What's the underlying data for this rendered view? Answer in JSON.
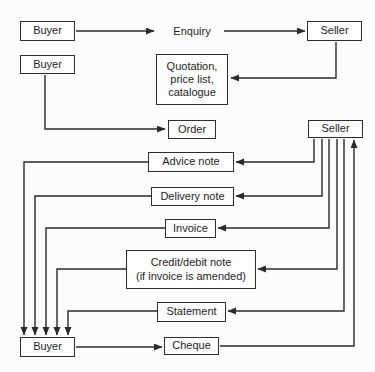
{
  "diagram": {
    "title_hint": "Flow of trade documents between buyer and seller",
    "background_color": "#fcfcfc",
    "line_color": "#2a2a2a",
    "box_border_color": "#2e2e2e",
    "nodes": {
      "buyer1": {
        "label": "Buyer"
      },
      "seller1": {
        "label": "Seller"
      },
      "buyer2": {
        "label": "Buyer"
      },
      "quotation": {
        "lines": [
          "Quotation,",
          "price list,",
          "catalogue"
        ]
      },
      "order": {
        "label": "Order"
      },
      "seller2": {
        "label": "Seller"
      },
      "advice": {
        "label": "Advice note"
      },
      "delivery": {
        "label": "Delivery note"
      },
      "invoice": {
        "label": "Invoice"
      },
      "creditdebit": {
        "lines": [
          "Credit/debit note",
          "(if invoice is amended)"
        ]
      },
      "statement": {
        "label": "Statement"
      },
      "buyer3": {
        "label": "Buyer"
      },
      "cheque": {
        "label": "Cheque"
      }
    },
    "labels": {
      "enquiry": "Enquiry"
    },
    "edges": [
      {
        "from": "buyer1",
        "to": "enquiry-label"
      },
      {
        "from": "enquiry-label",
        "to": "seller1"
      },
      {
        "from": "seller1",
        "to": "quotation"
      },
      {
        "from": "buyer2",
        "to": "order"
      },
      {
        "from": "seller2",
        "to": "advice"
      },
      {
        "from": "seller2",
        "to": "delivery"
      },
      {
        "from": "seller2",
        "to": "invoice"
      },
      {
        "from": "seller2",
        "to": "creditdebit"
      },
      {
        "from": "seller2",
        "to": "statement"
      },
      {
        "from": "advice",
        "to": "buyer3"
      },
      {
        "from": "delivery",
        "to": "buyer3"
      },
      {
        "from": "invoice",
        "to": "buyer3"
      },
      {
        "from": "creditdebit",
        "to": "buyer3"
      },
      {
        "from": "statement",
        "to": "buyer3"
      },
      {
        "from": "buyer3",
        "to": "cheque"
      },
      {
        "from": "cheque",
        "to": "seller2"
      }
    ]
  }
}
